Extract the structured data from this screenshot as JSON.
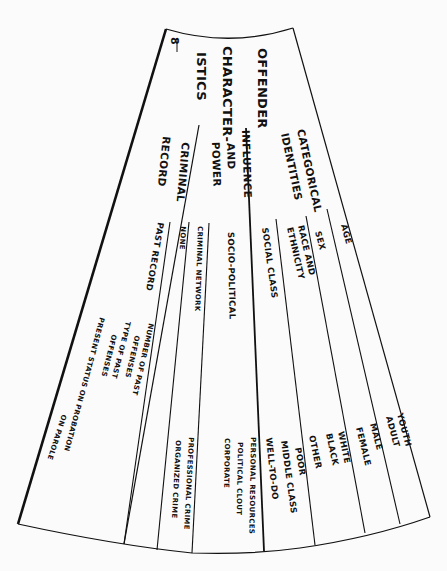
{
  "page_number": "8",
  "title": {
    "line1": "OFFENDER",
    "line2": "CHARACTER-",
    "line3": "ISTICS"
  },
  "sections": [
    {
      "label_lines": [
        "CATEGORICAL",
        "IDENTITIES"
      ],
      "items": [
        {
          "label_lines": [
            "AGE"
          ],
          "values": [
            "YOUTH",
            "ADULT"
          ]
        },
        {
          "label_lines": [
            "SEX"
          ],
          "values": [
            "MALE",
            "FEMALE"
          ]
        },
        {
          "label_lines": [
            "RACE AND",
            "ETHNICITY"
          ],
          "values": [
            "WHITE",
            "BLACK",
            "OTHER"
          ]
        },
        {
          "label_lines": [
            "SOCIAL CLASS"
          ],
          "values": [
            "POOR",
            "MIDDLE CLASS",
            "WELL-TO-DO"
          ]
        }
      ]
    },
    {
      "label_lines": [
        "INFLUENCE",
        "AND",
        "POWER"
      ],
      "items": [
        {
          "label_lines": [
            "SOCIO-POLITICAL"
          ],
          "values": [
            "PERSONAL RESOURCES",
            "POLITICAL CLOUT",
            "CORPORATE"
          ]
        },
        {
          "label_lines": [
            "CRIMINAL NETWORK"
          ],
          "values": [
            "PROFESSIONAL CRIME",
            "ORGANIZED CRIME"
          ]
        },
        {
          "label_lines": [
            "NONE"
          ],
          "values": []
        }
      ]
    },
    {
      "label_lines": [
        "CRIMINAL",
        "RECORD"
      ],
      "items": [
        {
          "label_lines": [
            "PAST RECORD"
          ],
          "values": [
            "NUMBER OF PAST",
            "OFFENSES",
            "TYPE OF PAST",
            "OFFENSES"
          ]
        },
        {
          "label_lines": [
            "PRESENT STATUS ON PROBATION",
            "ON PAROLE"
          ],
          "values": []
        }
      ]
    }
  ],
  "colors": {
    "ink": "#111111",
    "paper": "#fbfbfb"
  }
}
